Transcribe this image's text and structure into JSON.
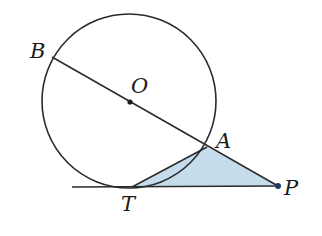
{
  "diagram": {
    "title": "",
    "colors": {
      "stroke": "#2a2a2a",
      "fill_triangle": "#c5dcec",
      "point": "#1f3a5f",
      "background": "#ffffff"
    },
    "circle": {
      "center": "O",
      "cx": 129,
      "cy": 101,
      "r": 87
    },
    "points": {
      "B": {
        "label": "B",
        "x": 52,
        "y": 57
      },
      "O": {
        "label": "O",
        "x": 130,
        "y": 102
      },
      "A": {
        "label": "A",
        "x": 207,
        "y": 147
      },
      "T": {
        "label": "T",
        "x": 132,
        "y": 187
      },
      "P": {
        "label": "P",
        "x": 278,
        "y": 186
      }
    },
    "segments": [
      {
        "from": "B",
        "to": "P",
        "note": "secant through O and A"
      },
      {
        "from": "T",
        "to": "P",
        "note": "tangent line at T"
      },
      {
        "from": "T",
        "to": "A"
      }
    ],
    "shaded_region": {
      "vertices": [
        "T",
        "A",
        "P"
      ],
      "description": "triangle TAP shaded light blue"
    },
    "labels": {
      "B": "B",
      "O": "O",
      "A": "A",
      "T": "T",
      "P": "P"
    }
  }
}
